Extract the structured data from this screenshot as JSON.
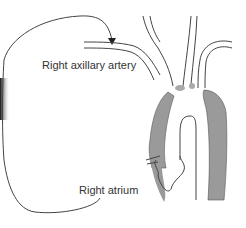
{
  "diagram": {
    "labels": {
      "right_axillary_artery": "Right axillary artery",
      "right_atrium": "Right atrium"
    },
    "colors": {
      "line": "#444444",
      "shaded_wall": "#9a9a9a",
      "background": "#ffffff"
    }
  }
}
